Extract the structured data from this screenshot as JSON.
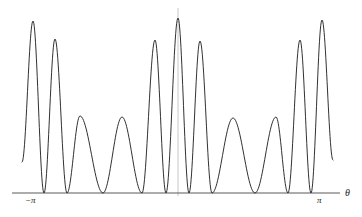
{
  "figure": {
    "title": "",
    "background_color": "#ffffff",
    "width": 362,
    "height": 217
  },
  "axes": {
    "x_axis": {
      "label": "θ",
      "label_name": "theta-axis-label",
      "color": "#555555",
      "baseline_y": 193,
      "x_start": 12,
      "x_end": 340,
      "ticks": [
        {
          "label": "−π",
          "x": 33
        },
        {
          "label": "π",
          "x": 322
        }
      ]
    },
    "y_axis": {
      "label": "",
      "color": "#bdbdbd",
      "x_position": 178,
      "visible": true,
      "top_y": 8,
      "bottom_y": 196
    },
    "grid": false
  },
  "curve": {
    "color": "#1a1a1a",
    "stroke_width": 0.9,
    "fill": "none",
    "description": "Multi-slit interference intensity pattern"
  },
  "chart_data": {
    "type": "line",
    "title": "",
    "xlabel": "θ",
    "ylabel": "",
    "xlim": [
      -1.2566,
      1.2566
    ],
    "ylim": [
      0,
      1
    ],
    "grid": false,
    "legend": null,
    "x_tick_labels": [
      "−π",
      "π"
    ],
    "x_tick_values": [
      -1.0,
      1.0
    ],
    "series": [
      {
        "name": "intensity",
        "peaks": [
          {
            "x": 33,
            "y": 21,
            "kind": "principal",
            "height_frac": 0.94
          },
          {
            "x": 55,
            "y": 39,
            "kind": "principal",
            "height_frac": 0.84
          },
          {
            "x": 80,
            "y": 116,
            "kind": "secondary",
            "height_frac": 0.42
          },
          {
            "x": 122,
            "y": 117,
            "kind": "secondary",
            "height_frac": 0.41
          },
          {
            "x": 155,
            "y": 40,
            "kind": "principal",
            "height_frac": 0.83
          },
          {
            "x": 178,
            "y": 18,
            "kind": "principal",
            "height_frac": 0.97
          },
          {
            "x": 200,
            "y": 41,
            "kind": "principal",
            "height_frac": 0.82
          },
          {
            "x": 233,
            "y": 118,
            "kind": "secondary",
            "height_frac": 0.4
          },
          {
            "x": 276,
            "y": 117,
            "kind": "secondary",
            "height_frac": 0.41
          },
          {
            "x": 300,
            "y": 40,
            "kind": "principal",
            "height_frac": 0.83
          },
          {
            "x": 322,
            "y": 20,
            "kind": "principal",
            "height_frac": 0.95
          }
        ],
        "zeros_x": [
          44,
          67,
          103,
          142,
          166,
          189,
          212,
          255,
          288,
          311
        ],
        "endpoints": [
          {
            "x": 22,
            "y": 162
          },
          {
            "x": 333,
            "y": 160
          }
        ]
      }
    ]
  }
}
